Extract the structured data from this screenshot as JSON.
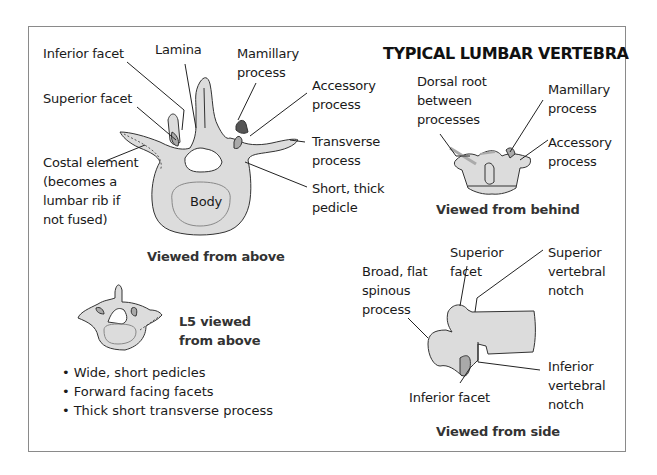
{
  "title": "TYPICAL LUMBAR VERTEBRA",
  "colors": {
    "bone_fill": "#dcdcdc",
    "bone_stroke": "#333333",
    "facet_fill": "#a9a9a9",
    "mamillary_fill": "#555555",
    "frame_border": "#8a8a8a"
  },
  "views": {
    "above": {
      "caption": "Viewed from above",
      "labels": {
        "inferior_facet": "Inferior facet",
        "lamina": "Lamina",
        "mamillary_process": [
          "Mamillary",
          "process"
        ],
        "accessory_process": [
          "Accessory",
          "process"
        ],
        "superior_facet": "Superior facet",
        "transverse_process": [
          "Transverse",
          "process"
        ],
        "costal_element": [
          "Costal element",
          "(becomes a",
          "lumbar rib if",
          "not fused)"
        ],
        "short_thick_pedicle": [
          "Short, thick",
          "pedicle"
        ],
        "body": "Body"
      }
    },
    "behind": {
      "caption": "Viewed from behind",
      "labels": {
        "dorsal_root": [
          "Dorsal root",
          "between",
          "processes"
        ],
        "mamillary_process": [
          "Mamillary",
          "process"
        ],
        "accessory_process": [
          "Accessory",
          "process"
        ]
      }
    },
    "l5": {
      "caption": [
        "L5 viewed",
        "from above"
      ],
      "bullets": [
        "Wide, short pedicles",
        "Forward facing facets",
        "Thick short transverse process"
      ]
    },
    "side": {
      "caption": "Viewed from side",
      "labels": {
        "superior_facet": [
          "Superior",
          "facet"
        ],
        "superior_vertebral_notch": [
          "Superior",
          "vertebral",
          "notch"
        ],
        "spinous_process": [
          "Broad, flat",
          "spinous",
          "process"
        ],
        "inferior_vertebral_notch": [
          "Inferior",
          "vertebral",
          "notch"
        ],
        "inferior_facet": "Inferior facet"
      }
    }
  }
}
